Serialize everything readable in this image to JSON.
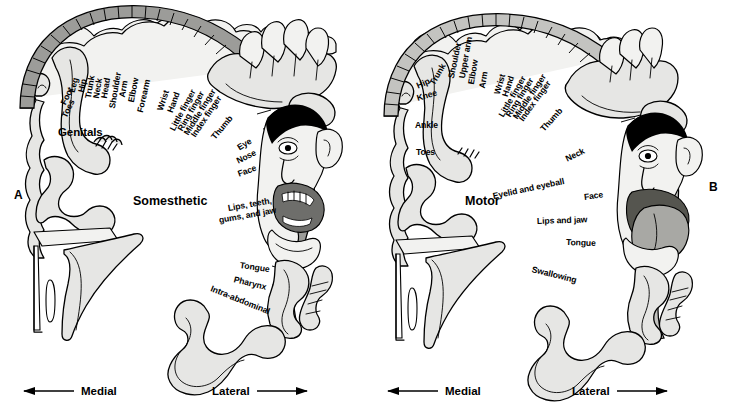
{
  "figure": {
    "kind": "penfield-homunculus-diagram",
    "panels": [
      {
        "letter": "A",
        "letter_position": "left",
        "center_label": "Somesthetic",
        "inline_label": "Genitals",
        "strip_shade": "#9c9c99",
        "arc_labels": [
          "Toes",
          "Foot",
          "Leg",
          "Hip",
          "Trunk",
          "Neck",
          "Head",
          "Shoulder",
          "Arm",
          "Elbow",
          "Forearm",
          "Wrist",
          "Hand",
          "Little finger",
          "Ring finger",
          "Middle finger",
          "Index finger",
          "Thumb",
          "Eye",
          "Nose",
          "Face",
          "Lips, teeth,",
          "gums, and jaw",
          "Tongue",
          "Pharynx",
          "Intra-abdominal"
        ],
        "axis": {
          "medial": "Medial",
          "lateral": "Lateral"
        }
      },
      {
        "letter": "B",
        "letter_position": "right",
        "center_label": "Motor",
        "inline_label": "",
        "strip_shade": "#c3c3c0",
        "arc_labels": [
          "Toes",
          "Ankle",
          "Knee",
          "Hip",
          "Trunk",
          "Shoulder",
          "Upper arm",
          "Elbow",
          "Arm",
          "Wrist",
          "Hand",
          "Little finger",
          "Ring finger",
          "Middle finger",
          "Index finger",
          "Thumb",
          "Neck",
          "Eyelid and eyeball",
          "Face",
          "Lips and jaw",
          "Tongue",
          "Swallowing"
        ],
        "axis": {
          "medial": "Medial",
          "lateral": "Lateral"
        }
      }
    ]
  },
  "panel_a": {
    "letter": "A",
    "center_label": "Somesthetic",
    "genitals": "Genitals",
    "l_toes": "Toes",
    "l_foot": "Foot",
    "l_leg": "Leg",
    "l_hip": "Hip",
    "l_trunk": "Trunk",
    "l_neck": "Neck",
    "l_head": "Head",
    "l_shoulder": "Shoulder",
    "l_arm": "Arm",
    "l_elbow": "Elbow",
    "l_forearm": "Forearm",
    "l_wrist": "Wrist",
    "l_hand": "Hand",
    "l_little": "Little finger",
    "l_ring": "Ring finger",
    "l_middle": "Middle finger",
    "l_index": "Index finger",
    "l_thumb": "Thumb",
    "l_eye": "Eye",
    "l_nose": "Nose",
    "l_face": "Face",
    "l_lips1": "Lips, teeth,",
    "l_lips2": "gums, and jaw",
    "l_tongue": "Tongue",
    "l_pharynx": "Pharynx",
    "l_intra": "Intra-abdominal",
    "axis_medial": "Medial",
    "axis_lateral": "Lateral"
  },
  "panel_b": {
    "letter": "B",
    "center_label": "Motor",
    "l_toes": "Toes",
    "l_ankle": "Ankle",
    "l_knee": "Knee",
    "l_hip": "Hip",
    "l_trunk": "Trunk",
    "l_shoulder": "Shoulder",
    "l_upperarm": "Upper arm",
    "l_elbow": "Elbow",
    "l_arm": "Arm",
    "l_wrist": "Wrist",
    "l_hand": "Hand",
    "l_little": "Little finger",
    "l_ring": "Ring finger",
    "l_middle": "Middle finger",
    "l_index": "Index finger",
    "l_thumb": "Thumb",
    "l_neck": "Neck",
    "l_eyelid": "Eyelid and eyeball",
    "l_face": "Face",
    "l_lipsjaw": "Lips and jaw",
    "l_tongue": "Tongue",
    "l_swallow": "Swallowing",
    "axis_medial": "Medial",
    "axis_lateral": "Lateral"
  },
  "colors": {
    "background": "#ffffff",
    "ink": "#000000",
    "strip_sensory": "#9c9c99",
    "strip_motor": "#c3c3c0",
    "body_fill": "#e6e6e4",
    "body_light": "#f2f2f0",
    "mouth": "#6e6e6b",
    "hair": "#000000"
  }
}
